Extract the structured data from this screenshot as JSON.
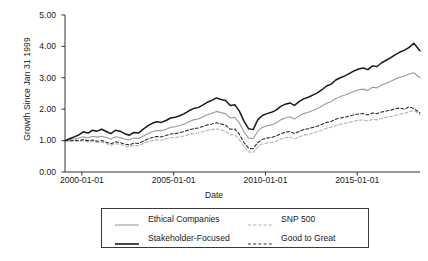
{
  "chart_data": {
    "type": "line",
    "title": "",
    "xlabel": "Date",
    "ylabel": "Growth Since Jan 31 1999",
    "grid": false,
    "legend_position": "bottom",
    "xlim": [
      "1999-01-31",
      "2018-06-01"
    ],
    "ylim": [
      0.0,
      5.0
    ],
    "yticks": [
      "0.00",
      "1.00",
      "2.00",
      "3.00",
      "4.00",
      "5.00"
    ],
    "ytick_values": [
      0.0,
      1.0,
      2.0,
      3.0,
      4.0,
      5.0
    ],
    "xticks": [
      "2000-01-01",
      "2005-01-01",
      "2010-01-01",
      "2015-01-01"
    ],
    "xtick_values": [
      2000,
      2005,
      2010,
      2015
    ],
    "x": [
      1999.08,
      1999.33,
      1999.58,
      1999.83,
      2000.08,
      2000.33,
      2000.58,
      2000.83,
      2001.08,
      2001.33,
      2001.58,
      2001.83,
      2002.08,
      2002.33,
      2002.58,
      2002.83,
      2003.08,
      2003.33,
      2003.58,
      2003.83,
      2004.08,
      2004.33,
      2004.58,
      2004.83,
      2005.08,
      2005.33,
      2005.58,
      2005.83,
      2006.08,
      2006.33,
      2006.58,
      2006.83,
      2007.08,
      2007.33,
      2007.58,
      2007.83,
      2008.08,
      2008.33,
      2008.58,
      2008.83,
      2009.08,
      2009.33,
      2009.58,
      2009.83,
      2010.08,
      2010.33,
      2010.58,
      2010.83,
      2011.08,
      2011.33,
      2011.58,
      2011.83,
      2012.08,
      2012.33,
      2012.58,
      2012.83,
      2013.08,
      2013.33,
      2013.58,
      2013.83,
      2014.08,
      2014.33,
      2014.58,
      2014.83,
      2015.08,
      2015.33,
      2015.58,
      2015.83,
      2016.08,
      2016.33,
      2016.58,
      2016.83,
      2017.08,
      2017.33,
      2017.58,
      2017.83,
      2018.08,
      2018.42
    ],
    "series": [
      {
        "name": "Stakeholder-Focused",
        "color": "#1a1a1a",
        "dash": "solid",
        "width": 1.5,
        "values": [
          1.0,
          1.06,
          1.12,
          1.18,
          1.28,
          1.24,
          1.33,
          1.3,
          1.36,
          1.29,
          1.22,
          1.33,
          1.3,
          1.22,
          1.17,
          1.26,
          1.24,
          1.36,
          1.47,
          1.55,
          1.6,
          1.58,
          1.64,
          1.72,
          1.74,
          1.79,
          1.86,
          1.95,
          2.02,
          2.05,
          2.13,
          2.22,
          2.28,
          2.36,
          2.31,
          2.28,
          2.12,
          2.14,
          1.94,
          1.62,
          1.38,
          1.35,
          1.66,
          1.8,
          1.86,
          1.9,
          1.97,
          2.09,
          2.16,
          2.2,
          2.12,
          2.24,
          2.33,
          2.38,
          2.45,
          2.52,
          2.62,
          2.74,
          2.8,
          2.93,
          3.0,
          3.06,
          3.14,
          3.22,
          3.28,
          3.31,
          3.26,
          3.38,
          3.36,
          3.48,
          3.56,
          3.64,
          3.74,
          3.82,
          3.88,
          3.97,
          4.1,
          3.86
        ]
      },
      {
        "name": "Ethical Companies",
        "color": "#9a9a9a",
        "dash": "solid",
        "width": 1.1,
        "values": [
          1.0,
          1.03,
          1.06,
          1.08,
          1.12,
          1.09,
          1.14,
          1.11,
          1.14,
          1.1,
          1.05,
          1.12,
          1.1,
          1.05,
          1.02,
          1.08,
          1.07,
          1.14,
          1.22,
          1.28,
          1.32,
          1.31,
          1.36,
          1.42,
          1.44,
          1.48,
          1.53,
          1.6,
          1.66,
          1.69,
          1.75,
          1.82,
          1.87,
          1.93,
          1.89,
          1.86,
          1.72,
          1.74,
          1.56,
          1.28,
          1.08,
          1.06,
          1.3,
          1.42,
          1.47,
          1.5,
          1.56,
          1.66,
          1.72,
          1.76,
          1.69,
          1.78,
          1.86,
          1.9,
          1.96,
          2.02,
          2.1,
          2.19,
          2.24,
          2.34,
          2.4,
          2.45,
          2.51,
          2.57,
          2.62,
          2.64,
          2.6,
          2.7,
          2.68,
          2.77,
          2.83,
          2.89,
          2.96,
          3.02,
          3.06,
          3.12,
          3.16,
          3.0
        ]
      },
      {
        "name": "Good to Great",
        "color": "#2e2e2e",
        "dash": "dashed",
        "width": 1.1,
        "values": [
          1.0,
          0.99,
          1.01,
          1.0,
          1.03,
          1.0,
          1.02,
          0.98,
          1.0,
          0.95,
          0.9,
          0.96,
          0.94,
          0.89,
          0.86,
          0.92,
          0.91,
          0.98,
          1.05,
          1.1,
          1.13,
          1.12,
          1.16,
          1.21,
          1.22,
          1.25,
          1.29,
          1.34,
          1.38,
          1.4,
          1.45,
          1.5,
          1.53,
          1.57,
          1.53,
          1.49,
          1.36,
          1.37,
          1.2,
          0.94,
          0.76,
          0.74,
          0.94,
          1.04,
          1.08,
          1.1,
          1.14,
          1.22,
          1.26,
          1.29,
          1.22,
          1.29,
          1.35,
          1.38,
          1.42,
          1.46,
          1.52,
          1.58,
          1.61,
          1.68,
          1.72,
          1.75,
          1.78,
          1.82,
          1.85,
          1.86,
          1.82,
          1.88,
          1.86,
          1.91,
          1.94,
          1.97,
          2.01,
          2.04,
          2.0,
          2.08,
          2.02,
          1.88
        ]
      },
      {
        "name": "SNP 500",
        "color": "#b4b4b4",
        "dash": "dashed",
        "width": 1.1,
        "values": [
          1.0,
          0.98,
          0.99,
          0.97,
          1.0,
          0.96,
          0.98,
          0.94,
          0.95,
          0.9,
          0.85,
          0.9,
          0.88,
          0.83,
          0.79,
          0.85,
          0.84,
          0.9,
          0.96,
          1.0,
          1.03,
          1.01,
          1.05,
          1.09,
          1.1,
          1.12,
          1.15,
          1.19,
          1.22,
          1.24,
          1.28,
          1.32,
          1.35,
          1.38,
          1.34,
          1.3,
          1.18,
          1.19,
          1.03,
          0.8,
          0.64,
          0.62,
          0.8,
          0.89,
          0.92,
          0.94,
          0.98,
          1.05,
          1.09,
          1.12,
          1.05,
          1.12,
          1.17,
          1.2,
          1.24,
          1.28,
          1.33,
          1.39,
          1.42,
          1.48,
          1.52,
          1.55,
          1.58,
          1.62,
          1.65,
          1.66,
          1.62,
          1.68,
          1.66,
          1.71,
          1.74,
          1.77,
          1.81,
          1.84,
          1.87,
          1.92,
          1.96,
          1.82
        ]
      }
    ],
    "legend_entries": [
      {
        "label": "Ethical Companies",
        "color": "#9a9a9a",
        "dash": "solid"
      },
      {
        "label": "Stakeholder-Focused",
        "color": "#1a1a1a",
        "dash": "solid"
      },
      {
        "label": "SNP 500",
        "color": "#b4b4b4",
        "dash": "dashed"
      },
      {
        "label": "Good to Great",
        "color": "#2e2e2e",
        "dash": "dashed"
      }
    ]
  }
}
